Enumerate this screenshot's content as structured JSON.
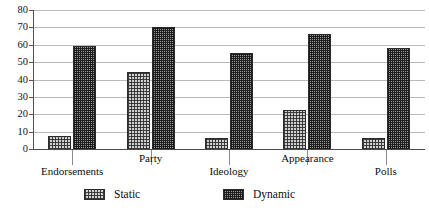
{
  "chart_data": {
    "type": "bar",
    "title": "",
    "xlabel": "",
    "ylabel": "",
    "ylim": [
      0,
      80
    ],
    "yticks": [
      0,
      10,
      20,
      30,
      40,
      50,
      60,
      70,
      80
    ],
    "grid": true,
    "legend_position": "bottom",
    "categories": [
      "Endorsements",
      "Party",
      "Ideology",
      "Appearance",
      "Polls"
    ],
    "series": [
      {
        "name": "Static",
        "values": [
          8,
          45,
          7,
          23,
          7
        ]
      },
      {
        "name": "Dynamic",
        "values": [
          60,
          71,
          56,
          67,
          59
        ]
      }
    ]
  },
  "axis": {
    "y_tick_labels": [
      "80",
      "70",
      "60",
      "50",
      "40",
      "30",
      "20",
      "10",
      "0"
    ],
    "x_tick_labels": [
      "Endorsements",
      "Party",
      "Ideology",
      "Appearance",
      "Polls"
    ]
  },
  "legend": {
    "entries": [
      {
        "label": "Static",
        "swatch": "static-pattern-swatch"
      },
      {
        "label": "Dynamic",
        "swatch": "dynamic-pattern-swatch"
      }
    ]
  },
  "colors": {
    "static_fill": "#cfcfcf",
    "dynamic_fill": "#9a9a9a",
    "bar_outline": "#2b2b2b",
    "gridline": "#b9b9b9",
    "axis": "#4a4a4a",
    "text": "#0d0d0d",
    "background": "#ffffff"
  }
}
